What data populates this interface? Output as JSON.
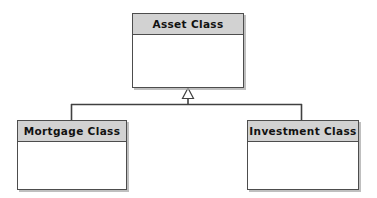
{
  "diagram": {
    "type": "uml-class-diagram",
    "relationship": "generalization",
    "canvas": {
      "width": 377,
      "height": 198,
      "background": "#ffffff"
    },
    "colors": {
      "header_fill": "#d2d2d2",
      "body_fill": "#ffffff",
      "border": "#4d4d4d",
      "connector": "#404040",
      "text": "#111111",
      "shadow": "#aaaaaa"
    },
    "classes": {
      "parent": {
        "name": "Asset Class",
        "role": "superclass"
      },
      "children": [
        {
          "name": "Mortgage Class",
          "role": "subclass"
        },
        {
          "name": "Investment Class",
          "role": "subclass"
        }
      ]
    }
  }
}
